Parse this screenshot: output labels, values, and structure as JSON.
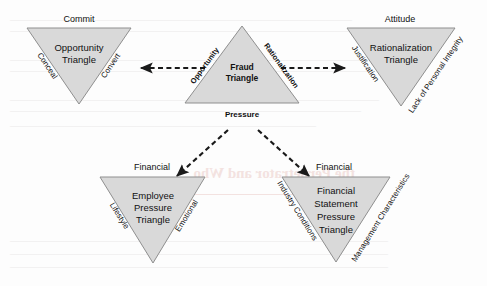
{
  "figure": {
    "background_color": "#fdfdfd",
    "triangle_fill": "#d9d9d9",
    "triangle_stroke": "#8f8f8f",
    "connector_color": "#1a1a1a"
  },
  "central": {
    "name": "fraud-triangle",
    "orientation": "upright",
    "core_line1": "Fraud",
    "core_line2": "Triangle",
    "left_edge": "Opportunity",
    "right_edge": "Rationalization",
    "bottom_edge": "Pressure"
  },
  "opportunity": {
    "name": "opportunity-triangle",
    "orientation": "inverted",
    "top_label": "Commit",
    "core_line1": "Opportunity",
    "core_line2": "Triangle",
    "left_edge": "Conceal",
    "right_edge": "Convert"
  },
  "rationalization": {
    "name": "rationalization-triangle",
    "orientation": "inverted",
    "top_label": "Attitude",
    "core_line1": "Rationalization",
    "core_line2": "Triangle",
    "left_edge": "Justification",
    "right_edge": "Lack of Personal Integrity"
  },
  "employee_pressure": {
    "name": "employee-pressure-triangle",
    "orientation": "inverted",
    "top_label": "Financial",
    "core_line1": "Employee",
    "core_line2": "Pressure",
    "core_line3": "Triangle",
    "left_edge": "Lifestyle",
    "right_edge": "Emotional"
  },
  "financial_statement_pressure": {
    "name": "financial-statement-pressure-triangle",
    "orientation": "inverted",
    "top_label": "Financial",
    "core_line1": "Financial",
    "core_line2": "Statement",
    "core_line3": "Pressure",
    "core_line4": "Triangle",
    "left_edge": "Industry Conditions",
    "right_edge": "Management Characteristics"
  },
  "connectors": [
    {
      "name": "opportunity-connector",
      "from": "fraud-triangle",
      "to": "opportunity-triangle",
      "style": "dashed-arrow"
    },
    {
      "name": "rationalization-connector",
      "from": "fraud-triangle",
      "to": "rationalization-triangle",
      "style": "dashed-arrow"
    },
    {
      "name": "pressure-left-connector",
      "from": "fraud-triangle",
      "to": "employee-pressure-triangle",
      "style": "dashed-arrow"
    },
    {
      "name": "pressure-right-connector",
      "from": "fraud-triangle",
      "to": "financial-statement-pressure-triangle",
      "style": "dashed-arrow"
    }
  ],
  "ghost_text": {
    "line1": "",
    "line2": "",
    "line3": "the Perpetrator and Who",
    "line4": "",
    "line5": ""
  }
}
